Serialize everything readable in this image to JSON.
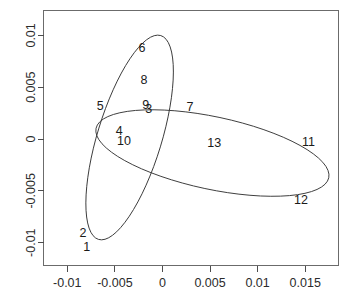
{
  "chart_data": {
    "type": "scatter",
    "title": "",
    "subtitle": "",
    "xlabel": "",
    "ylabel": "",
    "xlim": [
      -0.0125,
      0.0185
    ],
    "ylim": [
      -0.0122,
      0.0124
    ],
    "grid": false,
    "legend": null,
    "x_ticks": [
      -0.01,
      -0.005,
      0,
      0.005,
      0.01,
      0.015
    ],
    "x_tick_labels": [
      "-0.01",
      "-0.005",
      "0",
      "0.005",
      "0.01",
      "0.015"
    ],
    "y_ticks": [
      -0.01,
      -0.005,
      0,
      0.005,
      0.01
    ],
    "y_tick_labels": [
      "-0.01",
      "-0.005",
      "0",
      "0.005",
      "0.01"
    ],
    "point_label_style": "numeric-text",
    "points": [
      {
        "label": "1",
        "x": -0.00795,
        "y": -0.01045
      },
      {
        "label": "2",
        "x": -0.00835,
        "y": -0.00915
      },
      {
        "label": "3",
        "x": -0.00145,
        "y": 0.00285
      },
      {
        "label": "4",
        "x": -0.00455,
        "y": 0.00075
      },
      {
        "label": "5",
        "x": -0.00655,
        "y": 0.00315
      },
      {
        "label": "6",
        "x": -0.00215,
        "y": 0.0087
      },
      {
        "label": "7",
        "x": 0.0029,
        "y": 0.00305
      },
      {
        "label": "8",
        "x": -0.00195,
        "y": 0.00565
      },
      {
        "label": "9",
        "x": -0.00175,
        "y": 0.00325
      },
      {
        "label": "10",
        "x": -0.00405,
        "y": -0.00025
      },
      {
        "label": "11",
        "x": 0.01535,
        "y": -0.00035
      },
      {
        "label": "12",
        "x": 0.01455,
        "y": -0.00595
      },
      {
        "label": "13",
        "x": 0.00545,
        "y": -0.00045
      }
    ],
    "ellipses": [
      {
        "name": "cluster-ellipse-steep",
        "center_x": -0.00345,
        "center_y": 0.00015,
        "semi_major": 0.0112,
        "semi_minor": 0.0031,
        "rotation_deg": -73
      },
      {
        "name": "cluster-ellipse-wide",
        "center_x": 0.00525,
        "center_y": -0.00135,
        "semi_major": 0.0125,
        "semi_minor": 0.0035,
        "rotation_deg": 12
      }
    ]
  }
}
